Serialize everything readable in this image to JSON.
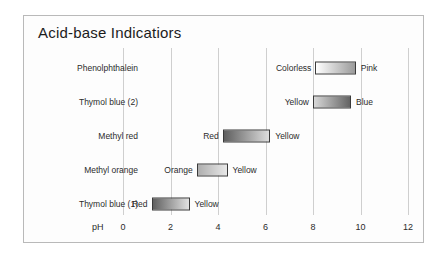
{
  "figure": {
    "title": "Acid-base Indicatiors",
    "axis_label": "pH"
  },
  "chart_data": {
    "type": "bar",
    "title": "Acid-base Indicatiors",
    "xlabel": "pH",
    "ylabel": "",
    "xlim": [
      0,
      12
    ],
    "ticks": [
      0,
      2,
      4,
      6,
      8,
      10,
      12
    ],
    "grid": true,
    "legend": "none",
    "orientation": "horizontal",
    "note": "Horizontal transition-range bars; each bar is a grayscale gradient from the acid-form color (left) to the base-form color (right).",
    "categories": [
      "Phenolphthalein",
      "Thymol blue (2)",
      "Methyl red",
      "Methyl orange",
      "Thymol blue (1)"
    ],
    "series": [
      {
        "name": "Phenolphthalein",
        "range_start": 8.1,
        "range_end": 9.8,
        "acid_color_name": "Colorless",
        "base_color_name": "Pink",
        "gradient_start_hex": "#ffffff",
        "gradient_end_hex": "#9a9a9a"
      },
      {
        "name": "Thymol blue (2)",
        "range_start": 8.0,
        "range_end": 9.6,
        "acid_color_name": "Yellow",
        "base_color_name": "Blue",
        "gradient_start_hex": "#d8d8d8",
        "gradient_end_hex": "#636363"
      },
      {
        "name": "Methyl red",
        "range_start": 4.2,
        "range_end": 6.2,
        "acid_color_name": "Red",
        "base_color_name": "Yellow",
        "gradient_start_hex": "#5e5e5e",
        "gradient_end_hex": "#dedede"
      },
      {
        "name": "Methyl orange",
        "range_start": 3.1,
        "range_end": 4.4,
        "acid_color_name": "Orange",
        "base_color_name": "Yellow",
        "gradient_start_hex": "#aeaeae",
        "gradient_end_hex": "#e8e8e8"
      },
      {
        "name": "Thymol blue (1)",
        "range_start": 1.2,
        "range_end": 2.8,
        "acid_color_name": "Red",
        "base_color_name": "Yellow",
        "gradient_start_hex": "#606060",
        "gradient_end_hex": "#e2e2e2"
      }
    ]
  }
}
